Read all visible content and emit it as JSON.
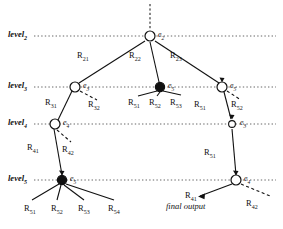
{
  "figure": {
    "background_color": "#ffffff",
    "line_color": "#111111",
    "guide_color": "#555555"
  },
  "levels": [
    {
      "id": "level2",
      "label": "level",
      "sub": "2",
      "y": 36,
      "x": 8
    },
    {
      "id": "level3",
      "label": "level",
      "sub": "3",
      "y": 87,
      "x": 8
    },
    {
      "id": "level4",
      "label": "level",
      "sub": "4",
      "y": 124,
      "x": 8
    },
    {
      "id": "level5",
      "label": "level",
      "sub": "5",
      "y": 180,
      "x": 8
    }
  ],
  "nodes": [
    {
      "id": "n-e2",
      "label": "e",
      "sub": "2",
      "x": 150,
      "y": 36,
      "filled": false,
      "label_x": 158,
      "label_y": 30
    },
    {
      "id": "n-e3-left",
      "label": "e",
      "sub": "3",
      "x": 75,
      "y": 87,
      "filled": false,
      "label_x": 83,
      "label_y": 81
    },
    {
      "id": "n-e5-mid",
      "label": "e",
      "sub": "5",
      "x": 160,
      "y": 87,
      "filled": true,
      "label_x": 168,
      "label_y": 81
    },
    {
      "id": "n-e5-right",
      "label": "e",
      "sub": "5",
      "x": 222,
      "y": 87,
      "filled": false,
      "label_x": 230,
      "label_y": 81
    },
    {
      "id": "n-e4-left",
      "label": "e",
      "sub": "4",
      "x": 55,
      "y": 124,
      "filled": false,
      "label_x": 63,
      "label_y": 118
    },
    {
      "id": "n-e3-right",
      "label": "e",
      "sub": "3",
      "x": 232,
      "y": 124,
      "filled": false,
      "label_x": 240,
      "label_y": 118
    },
    {
      "id": "n-e5-bottom",
      "label": "e",
      "sub": "5",
      "x": 62,
      "y": 180,
      "filled": true,
      "label_x": 70,
      "label_y": 174
    },
    {
      "id": "n-e4-bottom",
      "label": "e",
      "sub": "4",
      "x": 236,
      "y": 180,
      "filled": false,
      "label_x": 244,
      "label_y": 174
    }
  ],
  "edge_labels": [
    {
      "id": "R21",
      "label": "R",
      "sub": "21",
      "x": 77,
      "y": 56
    },
    {
      "id": "R22",
      "label": "R",
      "sub": "22",
      "x": 129,
      "y": 56
    },
    {
      "id": "R23",
      "label": "R",
      "sub": "23",
      "x": 170,
      "y": 56
    },
    {
      "id": "R31",
      "label": "R",
      "sub": "31",
      "x": 45,
      "y": 102
    },
    {
      "id": "R32",
      "label": "R",
      "sub": "32",
      "x": 88,
      "y": 103
    },
    {
      "id": "R51-mid-1",
      "label": "R",
      "sub": "51",
      "x": 132,
      "y": 101
    },
    {
      "id": "R52-mid-2",
      "label": "R",
      "sub": "52",
      "x": 152,
      "y": 101
    },
    {
      "id": "R53-mid-3",
      "label": "R",
      "sub": "53",
      "x": 172,
      "y": 101
    },
    {
      "id": "R51-right",
      "label": "R",
      "sub": "51",
      "x": 197,
      "y": 103
    },
    {
      "id": "R52-right",
      "label": "R",
      "sub": "52",
      "x": 233,
      "y": 103
    },
    {
      "id": "R41",
      "label": "R",
      "sub": "41",
      "x": 28,
      "y": 146
    },
    {
      "id": "R42",
      "label": "R",
      "sub": "42",
      "x": 63,
      "y": 148
    },
    {
      "id": "R51-vert",
      "label": "R",
      "sub": "51",
      "x": 206,
      "y": 151
    },
    {
      "id": "R51-bot",
      "label": "R",
      "sub": "51",
      "x": 25,
      "y": 207
    },
    {
      "id": "R52-bot",
      "label": "R",
      "sub": "52",
      "x": 52,
      "y": 207
    },
    {
      "id": "R53-bot",
      "label": "R",
      "sub": "53",
      "x": 79,
      "y": 207
    },
    {
      "id": "R54-bot",
      "label": "R",
      "sub": "54",
      "x": 109,
      "y": 207
    },
    {
      "id": "R41-final",
      "label": "R",
      "sub": "41",
      "x": 186,
      "y": 197
    },
    {
      "id": "R42-final",
      "label": "R",
      "sub": "42",
      "x": 247,
      "y": 203
    }
  ],
  "annotations": [
    {
      "id": "final-output",
      "text": "final output",
      "x": 166,
      "y": 207
    }
  ]
}
